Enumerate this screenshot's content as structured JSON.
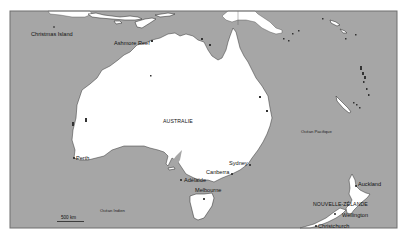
{
  "map": {
    "colors": {
      "sea": "#a6a6a6",
      "land": "#ffffff",
      "coastline": "#333333",
      "text": "#111111"
    },
    "countries": [
      {
        "id": "australia",
        "label": "AUSTRALIE"
      },
      {
        "id": "new-zealand",
        "label": "NOUVELLE-ZÉLANDE"
      }
    ],
    "oceans": [
      {
        "id": "pacific",
        "label": "Océan Pacifique"
      },
      {
        "id": "indian",
        "label": "Océan Indien"
      }
    ],
    "places": [
      {
        "id": "christmas-island",
        "label": "Christmas Island"
      },
      {
        "id": "ashmore-reef",
        "label": "Ashmore Reef"
      },
      {
        "id": "perth",
        "label": "Perth"
      },
      {
        "id": "adelaide",
        "label": "Adélaïde"
      },
      {
        "id": "melbourne",
        "label": "Melbourne"
      },
      {
        "id": "canberra",
        "label": "Canberra"
      },
      {
        "id": "sydney",
        "label": "Sydney"
      },
      {
        "id": "auckland",
        "label": "Auckland"
      },
      {
        "id": "wellington",
        "label": "Wellington"
      },
      {
        "id": "christchurch",
        "label": "Christchurch"
      }
    ],
    "scale": {
      "label": "500 km"
    }
  }
}
